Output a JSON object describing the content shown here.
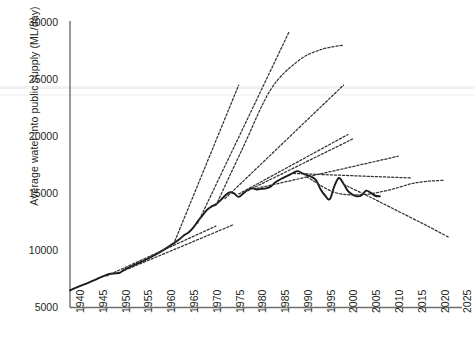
{
  "chart_data": {
    "type": "line",
    "title": "",
    "xlabel": "",
    "ylabel": "Average water into public supply (ML/day)",
    "xlim": [
      1940,
      2026
    ],
    "ylim": [
      5000,
      30000
    ],
    "grid": false,
    "legend_position": "none",
    "yticks": [
      5000,
      10000,
      15000,
      20000,
      25000,
      30000
    ],
    "xticks": [
      1940,
      1945,
      1950,
      1955,
      1960,
      1965,
      1970,
      1975,
      1980,
      1985,
      1990,
      1995,
      2000,
      2005,
      2010,
      2015,
      2020,
      2025
    ],
    "series": [
      {
        "name": "Actual water into public supply",
        "style": "solid",
        "color": "#1a1a1a",
        "x": [
          1940,
          1942,
          1944,
          1946,
          1948,
          1949,
          1950,
          1951,
          1952,
          1954,
          1956,
          1958,
          1960,
          1962,
          1964,
          1965,
          1966,
          1967,
          1968,
          1969,
          1970,
          1971,
          1972,
          1973,
          1974,
          1975,
          1976,
          1977,
          1978,
          1979,
          1980,
          1981,
          1982,
          1983,
          1984,
          1985,
          1986,
          1987,
          1988,
          1989,
          1990,
          1991,
          1992,
          1993,
          1994,
          1995,
          1996,
          1997,
          1998,
          1999,
          2000,
          2001,
          2002,
          2003,
          2004,
          2005,
          2006,
          2007,
          2008
        ],
        "y": [
          6500,
          6850,
          7150,
          7500,
          7850,
          7950,
          7980,
          8050,
          8300,
          8700,
          9050,
          9450,
          9900,
          10400,
          10950,
          11300,
          11550,
          11950,
          12500,
          13000,
          13500,
          13800,
          14000,
          14350,
          14750,
          15050,
          14950,
          14650,
          14950,
          15250,
          15400,
          15300,
          15350,
          15400,
          15550,
          15900,
          16150,
          16350,
          16550,
          16750,
          16900,
          16700,
          16550,
          16400,
          16100,
          15300,
          14750,
          14450,
          15600,
          16300,
          15800,
          15150,
          14850,
          14700,
          14800,
          15200,
          15000,
          14750,
          14700
        ]
      },
      {
        "name": "Projection from 1950",
        "style": "dashed",
        "color": "#333333",
        "x": [
          1948,
          1972
        ],
        "y": [
          7750,
          12100
        ]
      },
      {
        "name": "Projection from 1955",
        "style": "dashed",
        "color": "#333333",
        "x": [
          1952,
          1976
        ],
        "y": [
          8250,
          12250
        ]
      },
      {
        "name": "Projection from 1965 (high)",
        "style": "dashed",
        "color": "#333333",
        "x": [
          1963,
          1977
        ],
        "y": [
          10800,
          24400
        ]
      },
      {
        "name": "Projection from 1970 (high)",
        "style": "dashed",
        "color": "#333333",
        "x": [
          1968,
          1988
        ],
        "y": [
          12350,
          29000
        ]
      },
      {
        "name": "Projection from 1973 curved (saturating)",
        "style": "dashed",
        "color": "#333333",
        "x": [
          1972,
          1978,
          1984,
          1990,
          1995,
          2000
        ],
        "y": [
          13900,
          19000,
          24000,
          26500,
          27500,
          27900
        ]
      },
      {
        "name": "Projection from 1975",
        "style": "dashed",
        "color": "#333333",
        "x": [
          1974,
          2000
        ],
        "y": [
          14500,
          24400
        ]
      },
      {
        "name": "Projection from 1979 (moderate)",
        "style": "dashed",
        "color": "#333333",
        "x": [
          1977,
          2001
        ],
        "y": [
          14900,
          20100
        ]
      },
      {
        "name": "Projection from 1980 (moderate low)",
        "style": "dashed",
        "color": "#333333",
        "x": [
          1979,
          2002
        ],
        "y": [
          15200,
          19700
        ]
      },
      {
        "name": "Projection from 1982 (low growth)",
        "style": "dashed",
        "color": "#333333",
        "x": [
          1981,
          2012
        ],
        "y": [
          15400,
          18200
        ]
      },
      {
        "name": "Projection from 1990 (flat)",
        "style": "dashed",
        "color": "#333333",
        "x": [
          1989,
          2015
        ],
        "y": [
          16700,
          16300
        ]
      },
      {
        "name": "Projection from 1993 (declining then flat)",
        "style": "dashed",
        "color": "#333333",
        "x": [
          1992,
          1998,
          2004,
          2010,
          2016,
          2022
        ],
        "y": [
          16400,
          15050,
          14850,
          15250,
          15900,
          16100
        ]
      },
      {
        "name": "Projection from 2002 (strong decline)",
        "style": "dashed",
        "color": "#333333",
        "x": [
          2000,
          2006,
          2012,
          2018,
          2023
        ],
        "y": [
          15750,
          14600,
          13400,
          12200,
          11150
        ]
      }
    ]
  },
  "axis": {
    "ytick_labels": [
      "30000",
      "25000",
      "20000",
      "15000",
      "10000",
      "5000"
    ],
    "xtick_labels": [
      "1940",
      "1945",
      "1950",
      "1955",
      "1960",
      "1965",
      "1970",
      "1975",
      "1980",
      "1985",
      "1990",
      "1995",
      "2000",
      "2005",
      "2010",
      "2015",
      "2020",
      "2025"
    ],
    "ylabel_text": "Average water into public supply (ML/day)"
  },
  "colors": {
    "axis": "#6e6e6e",
    "data_line": "#1a1a1a",
    "projection_line": "#333333",
    "background": "#ffffff",
    "text": "#231f20"
  }
}
